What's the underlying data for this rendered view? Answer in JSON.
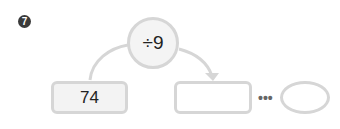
{
  "problem": {
    "number": "7",
    "operation": "÷9",
    "start_value": "74",
    "result_value": "",
    "remainder_value": "",
    "separator": "•••"
  },
  "colors": {
    "number_badge": "#3a3a3a",
    "border": "#d6d6d6",
    "fill": "#f3f3f3"
  }
}
